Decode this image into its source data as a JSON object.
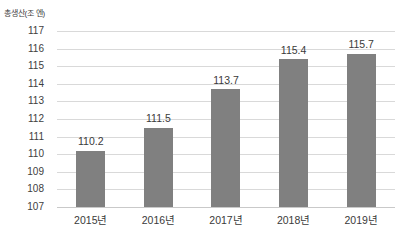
{
  "chart_data": {
    "type": "bar",
    "title": "총생산(조 엔)",
    "xlabel": "",
    "ylabel": "총생산(조 엔)",
    "categories": [
      "2015년",
      "2016년",
      "2017년",
      "2018년",
      "2019년"
    ],
    "values": [
      110.2,
      111.5,
      113.7,
      115.4,
      115.7
    ],
    "value_labels": [
      "110.2",
      "111.5",
      "113.7",
      "115.4",
      "115.7"
    ],
    "ylim": [
      107,
      117
    ],
    "ytick_step": 1,
    "yticks": [
      117,
      116,
      115,
      114,
      113,
      112,
      111,
      110,
      109,
      108,
      107
    ],
    "ytick_labels": [
      "117",
      "116",
      "115",
      "114",
      "113",
      "112",
      "111",
      "110",
      "109",
      "108",
      "107"
    ],
    "grid": true,
    "grid_axis": "y",
    "legend": false,
    "legend_position": "none",
    "series": [
      {
        "name": "총생산",
        "values": [
          110.2,
          111.5,
          113.7,
          115.4,
          115.7
        ]
      }
    ]
  },
  "colors": {
    "bar": "#808080",
    "gridline": "#d9d9d9",
    "baseline": "#c9c9c9",
    "text": "#3a3a3a",
    "background": "#ffffff"
  }
}
